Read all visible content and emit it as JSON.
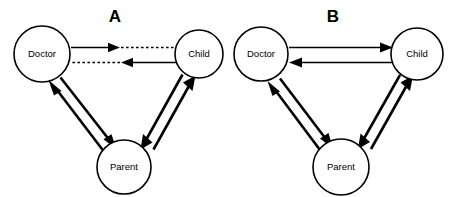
{
  "figure": {
    "width": 455,
    "height": 197,
    "background_color": "#ffffff",
    "line_color": "#000000",
    "type": "node-link-diagram",
    "panels": [
      {
        "id": "A",
        "letter": "A",
        "nodes": [
          {
            "id": "doctor",
            "label": "Doctor",
            "cx": 42,
            "cy": 54,
            "r": 28
          },
          {
            "id": "child",
            "label": "Child",
            "cx": 199,
            "cy": 54,
            "r": 24
          },
          {
            "id": "parent",
            "label": "Parent",
            "cx": 124,
            "cy": 167,
            "r": 27
          }
        ],
        "edges": [
          {
            "from": "doctor",
            "to": "child",
            "style": "solid-then-dashed",
            "weight": "thin",
            "direction": "right"
          },
          {
            "from": "child",
            "to": "doctor",
            "style": "solid-then-dashed",
            "weight": "thin",
            "direction": "left"
          },
          {
            "from": "doctor",
            "to": "parent",
            "style": "solid",
            "weight": "thick",
            "direction": "down-right"
          },
          {
            "from": "parent",
            "to": "doctor",
            "style": "solid",
            "weight": "thick",
            "direction": "up-left"
          },
          {
            "from": "child",
            "to": "parent",
            "style": "solid",
            "weight": "thick",
            "direction": "down-left"
          },
          {
            "from": "parent",
            "to": "child",
            "style": "solid",
            "weight": "thick",
            "direction": "up-right"
          }
        ]
      },
      {
        "id": "B",
        "letter": "B",
        "nodes": [
          {
            "id": "doctor",
            "label": "Doctor",
            "cx": 261,
            "cy": 54,
            "r": 27
          },
          {
            "id": "child",
            "label": "Child",
            "cx": 417,
            "cy": 54,
            "r": 26
          },
          {
            "id": "parent",
            "label": "Parent",
            "cx": 341,
            "cy": 167,
            "r": 28
          }
        ],
        "edges": [
          {
            "from": "doctor",
            "to": "child",
            "style": "solid",
            "weight": "thin",
            "direction": "right"
          },
          {
            "from": "child",
            "to": "doctor",
            "style": "solid",
            "weight": "thin",
            "direction": "left"
          },
          {
            "from": "doctor",
            "to": "parent",
            "style": "solid",
            "weight": "thick",
            "direction": "down-right"
          },
          {
            "from": "parent",
            "to": "doctor",
            "style": "solid",
            "weight": "thick",
            "direction": "up-left"
          },
          {
            "from": "child",
            "to": "parent",
            "style": "solid",
            "weight": "thick",
            "direction": "down-left"
          },
          {
            "from": "parent",
            "to": "child",
            "style": "solid",
            "weight": "thick",
            "direction": "up-right"
          }
        ]
      }
    ],
    "labels": {
      "doctor": "Doctor",
      "child": "Child",
      "parent": "Parent",
      "panel_a": "A",
      "panel_b": "B"
    }
  }
}
